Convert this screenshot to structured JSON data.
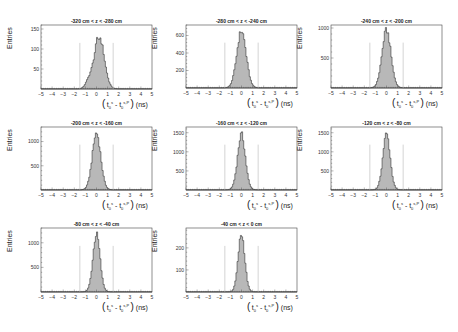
{
  "chart_data": [
    {
      "type": "bar",
      "title": "-320 cm < z < -280 cm",
      "xlabel": "(t0^s - t0^(s,P)) (ns)",
      "ylabel": "Entries",
      "xlim": [
        -5,
        5
      ],
      "ylim": [
        0,
        160
      ],
      "yticks": [
        50,
        100,
        150
      ],
      "xticks": [
        -5,
        -4,
        -3,
        -2,
        -1,
        0,
        1,
        2,
        3,
        4,
        5
      ],
      "cut_lines": [
        -1.5,
        1.5
      ],
      "peak_center": 0.2,
      "peak_sigma": 0.45,
      "peak_height": 145,
      "shape": "irregular"
    },
    {
      "type": "bar",
      "title": "-280 cm < z < -240 cm",
      "xlabel": "(t0^s - t0^(s,P)) (ns)",
      "ylabel": "Entries",
      "xlim": [
        -5,
        5
      ],
      "ylim": [
        0,
        720
      ],
      "yticks": [
        200,
        400,
        600
      ],
      "xticks": [
        -5,
        -4,
        -3,
        -2,
        -1,
        0,
        1,
        2,
        3,
        4,
        5
      ],
      "cut_lines": [
        -1.5,
        1.5
      ],
      "peak_center": 0.0,
      "peak_sigma": 0.42,
      "peak_height": 650,
      "shape": "gauss"
    },
    {
      "type": "bar",
      "title": "-240 cm < z < -200 cm",
      "xlabel": "(t0^s - t0^(s,P)) (ns)",
      "ylabel": "Entries",
      "xlim": [
        -5,
        5
      ],
      "ylim": [
        0,
        1050
      ],
      "yticks": [
        500,
        1000
      ],
      "xticks": [
        -5,
        -4,
        -3,
        -2,
        -1,
        0,
        1,
        2,
        3,
        4,
        5
      ],
      "cut_lines": [
        -1.5,
        1.5
      ],
      "peak_center": 0.0,
      "peak_sigma": 0.4,
      "peak_height": 960,
      "shape": "gauss"
    },
    {
      "type": "bar",
      "title": "-200 cm < z < -160 cm",
      "xlabel": "(t0^s - t0^(s,P)) (ns)",
      "ylabel": "Entries",
      "xlim": [
        -5,
        5
      ],
      "ylim": [
        0,
        1300
      ],
      "yticks": [
        500,
        1000
      ],
      "xticks": [
        -5,
        -4,
        -3,
        -2,
        -1,
        0,
        1,
        2,
        3,
        4,
        5
      ],
      "cut_lines": [
        -1.5,
        1.5
      ],
      "peak_center": 0.0,
      "peak_sigma": 0.38,
      "peak_height": 1170,
      "shape": "gauss"
    },
    {
      "type": "bar",
      "title": "-160 cm < z < -120 cm",
      "xlabel": "(t0^s - t0^(s,P)) (ns)",
      "ylabel": "Entries",
      "xlim": [
        -5,
        5
      ],
      "ylim": [
        0,
        1650
      ],
      "yticks": [
        500,
        1000,
        1500
      ],
      "xticks": [
        -5,
        -4,
        -3,
        -2,
        -1,
        0,
        1,
        2,
        3,
        4,
        5
      ],
      "cut_lines": [
        -1.5,
        1.5
      ],
      "peak_center": 0.0,
      "peak_sigma": 0.35,
      "peak_height": 1450,
      "shape": "gauss"
    },
    {
      "type": "bar",
      "title": "-120 cm < z < -80 cm",
      "xlabel": "(t0^s - t0^(s,P)) (ns)",
      "ylabel": "Entries",
      "xlim": [
        -5,
        5
      ],
      "ylim": [
        0,
        1650
      ],
      "yticks": [
        500,
        1000,
        1500
      ],
      "xticks": [
        -5,
        -4,
        -3,
        -2,
        -1,
        0,
        1,
        2,
        3,
        4,
        5
      ],
      "cut_lines": [
        -1.5,
        1.5
      ],
      "peak_center": 0.0,
      "peak_sigma": 0.33,
      "peak_height": 1460,
      "shape": "gauss"
    },
    {
      "type": "bar",
      "title": "-80 cm < z < -40 cm",
      "xlabel": "(t0^s - t0^(s,P)) (ns)",
      "ylabel": "Entries",
      "xlim": [
        -5,
        5
      ],
      "ylim": [
        0,
        1300
      ],
      "yticks": [
        500,
        1000
      ],
      "xticks": [
        -5,
        -4,
        -3,
        -2,
        -1,
        0,
        1,
        2,
        3,
        4,
        5
      ],
      "cut_lines": [
        -1.5,
        1.5
      ],
      "peak_center": 0.0,
      "peak_sigma": 0.32,
      "peak_height": 1170,
      "shape": "gauss"
    },
    {
      "type": "bar",
      "title": "-40 cm < z < 0 cm",
      "xlabel": "(t0^s - t0^(s,P)) (ns)",
      "ylabel": "Entries",
      "xlim": [
        -5,
        5
      ],
      "ylim": [
        0,
        290
      ],
      "yticks": [
        100,
        200
      ],
      "xticks": [
        -5,
        -4,
        -3,
        -2,
        -1,
        0,
        1,
        2,
        3,
        4,
        5
      ],
      "cut_lines": [
        -1.5,
        1.5
      ],
      "peak_center": 0.0,
      "peak_sigma": 0.3,
      "peak_height": 260,
      "shape": "gauss"
    }
  ],
  "colors": {
    "fill": "#b8b8b8",
    "outline": "#333333",
    "cut_line": "#c8c8c8",
    "frame": "#444444"
  },
  "labels": {
    "ylabel": "Entries",
    "xlabel_unit": "(ns)"
  }
}
